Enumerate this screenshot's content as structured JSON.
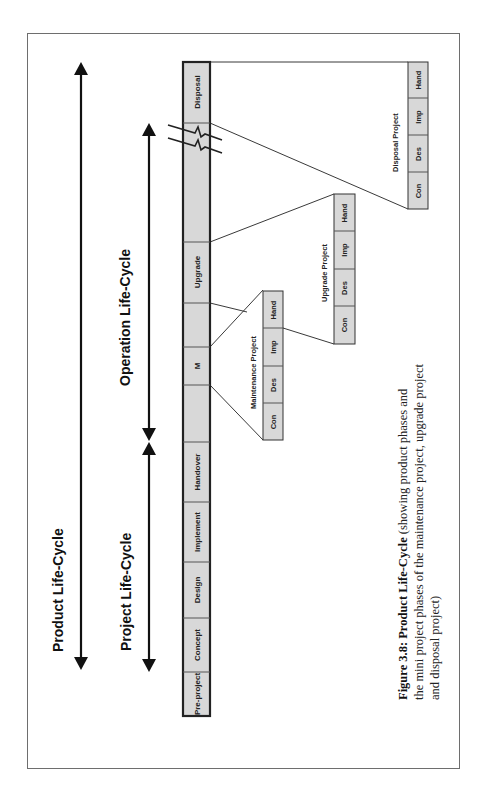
{
  "diagram": {
    "orientation": "rotated 90deg counter-clockwise",
    "colors": {
      "segment_fill": "#d8d8d8",
      "mini_fill": "#d8d8d8",
      "line": "#222222",
      "frame": "#6e6e6e"
    },
    "arrows": {
      "product": {
        "label": "Product Life-Cycle"
      },
      "project": {
        "label": "Project Life-Cycle"
      },
      "operation": {
        "label": "Operation Life-Cycle"
      }
    },
    "phase_bar": {
      "segments": [
        {
          "label": "Pre-project"
        },
        {
          "label": "Concept"
        },
        {
          "label": "Design"
        },
        {
          "label": "Implement"
        },
        {
          "label": "Handover"
        },
        {
          "label": ""
        },
        {
          "label": "M"
        },
        {
          "label": ""
        },
        {
          "label": "Upgrade"
        },
        {
          "label": ""
        },
        {
          "label": "Disposal"
        }
      ]
    },
    "mini_projects": [
      {
        "title": "Maintenance Project",
        "phases": [
          "Con",
          "Des",
          "Imp",
          "Hand"
        ]
      },
      {
        "title": "Upgrade Project",
        "phases": [
          "Con",
          "Des",
          "Imp",
          "Hand"
        ]
      },
      {
        "title": "Disposal Project",
        "phases": [
          "Con",
          "Des",
          "Imp",
          "Hand"
        ]
      }
    ]
  },
  "caption": {
    "bold": "Figure 3.8: Product Life-Cycle",
    "line1_rest": " (showing product phases and",
    "line2": "the mini project phases of the maintenance project, upgrade project",
    "line3": "and disposal project)"
  }
}
